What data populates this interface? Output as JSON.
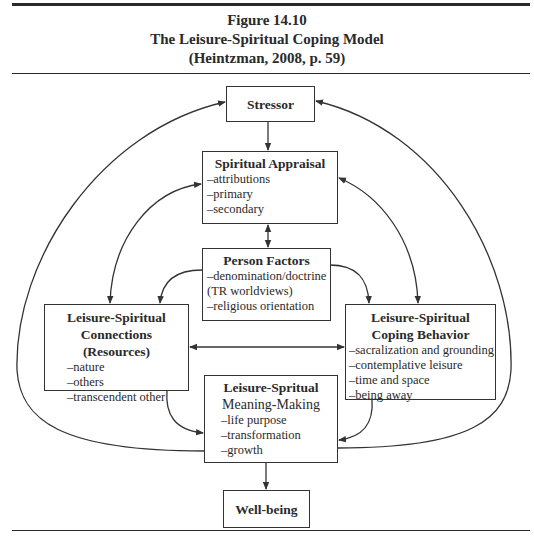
{
  "header": {
    "figure_number": "Figure 14.10",
    "title": "The Leisure-Spiritual Coping Model",
    "citation": "(Heintzman, 2008, p. 59)"
  },
  "nodes": {
    "stressor": {
      "title": "Stressor"
    },
    "spiritual_appraisal": {
      "title": "Spiritual Appraisal",
      "items": [
        "–attributions",
        "–primary",
        "–secondary"
      ]
    },
    "person_factors": {
      "title": "Person Factors",
      "items": [
        "–denomination/doctrine",
        "(TR worldviews)",
        "–religious orientation"
      ]
    },
    "connections": {
      "title_line1": "Leisure-Spiritual",
      "title_line2": "Connections (Resources)",
      "items": [
        "–nature",
        "–others",
        "–transcendent other"
      ]
    },
    "coping_behavior": {
      "title_line1": "Leisure-Spiritual",
      "title_line2": "Coping Behavior",
      "items": [
        "–sacralization and grounding",
        "–contemplative leisure",
        "–time and space",
        "–being away"
      ]
    },
    "meaning_making": {
      "title": "Leisure-Spritual",
      "subtitle": "Meaning-Making",
      "items": [
        "–life purpose",
        "–transformation",
        "–growth"
      ]
    },
    "well_being": {
      "title": "Well-being"
    }
  },
  "edges": [
    {
      "from": "stressor",
      "to": "spiritual_appraisal",
      "type": "arrow"
    },
    {
      "from": "spiritual_appraisal",
      "to": "person_factors",
      "type": "double-arrow"
    },
    {
      "from": "person_factors",
      "to": "connections",
      "type": "arrow"
    },
    {
      "from": "person_factors",
      "to": "coping_behavior",
      "type": "arrow"
    },
    {
      "from": "connections",
      "to": "coping_behavior",
      "type": "double-arrow"
    },
    {
      "from": "spiritual_appraisal",
      "to": "connections",
      "type": "double-arrow"
    },
    {
      "from": "spiritual_appraisal",
      "to": "coping_behavior",
      "type": "double-arrow"
    },
    {
      "from": "connections",
      "to": "meaning_making",
      "type": "arrow"
    },
    {
      "from": "coping_behavior",
      "to": "meaning_making",
      "type": "arrow"
    },
    {
      "from": "meaning_making",
      "to": "stressor",
      "type": "arrow",
      "route": "left-outer-loop"
    },
    {
      "from": "meaning_making",
      "to": "stressor",
      "type": "arrow",
      "route": "right-outer-loop"
    },
    {
      "from": "meaning_making",
      "to": "well_being",
      "type": "arrow"
    }
  ],
  "colors": {
    "line": "#333333",
    "text": "#2a2a2a",
    "background": "#ffffff"
  }
}
